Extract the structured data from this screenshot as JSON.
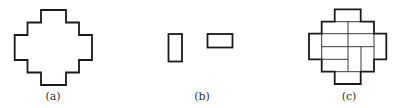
{
  "figure": {
    "panels": [
      {
        "id": "a",
        "caption": "(a)",
        "caption_x": 53,
        "outline": "M41,10 H66 V22.5 H79 V35 H92 V60 H79 V72.5 H66 V85 H41 V72.5 H27.5 V60 H14.7 V35 H27.5 V22.5 H41 Z",
        "rects": [],
        "inner_lines": []
      },
      {
        "id": "b",
        "caption": "(b)",
        "caption_x": 202,
        "outline": "",
        "rects": [
          {
            "name": "vertical-domino",
            "x": 168.5,
            "y": 34,
            "w": 13.5,
            "h": 27.5
          },
          {
            "name": "horizontal-domino",
            "x": 207.5,
            "y": 34,
            "w": 25,
            "h": 13.5
          }
        ],
        "inner_lines": []
      },
      {
        "id": "c",
        "caption": "(c)",
        "caption_x": 349,
        "outline": "M334.7,9.3 H360.7 V21.7 H374 V33.7 H386.3 V59.3 H374 V71.7 H360.7 V84 H334.7 V71.7 H321.7 V59.3 H309 V33.7 H321.7 V21.7 H334.7 Z",
        "rects": [],
        "inner_lines": [
          [
            334.7,
            21.7,
            360.7,
            21.7
          ],
          [
            321.7,
            33.7,
            374,
            33.7
          ],
          [
            321.7,
            33.7,
            321.7,
            59.3
          ],
          [
            374,
            33.7,
            374,
            59.3
          ],
          [
            348,
            21.7,
            348,
            71.7
          ],
          [
            321.7,
            46.7,
            374,
            46.7
          ],
          [
            321.7,
            59.3,
            348,
            59.3
          ],
          [
            361,
            46.7,
            361,
            71.7
          ],
          [
            334.7,
            71.7,
            360.7,
            71.7
          ]
        ]
      }
    ]
  }
}
